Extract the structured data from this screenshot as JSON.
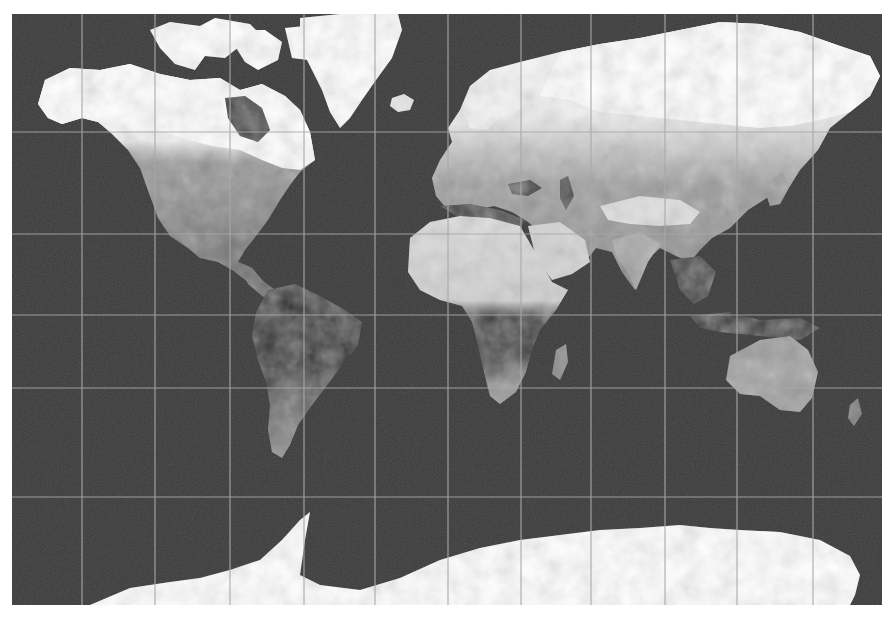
{
  "map": {
    "type": "world-map",
    "projection": "mercator",
    "style": "grayscale-satellite",
    "frame": {
      "x": 12,
      "y": 14,
      "width": 870,
      "height": 591
    },
    "colors": {
      "ocean": "#3a3a3a",
      "grid": "#a8a8a8",
      "ice": "#ffffff",
      "desert": "#d8d8d8",
      "vegetation_dark": "#262626",
      "land_mid": "#8a8a8a",
      "land_light": "#b8b8b8",
      "background": "#ffffff"
    },
    "graticule": {
      "vertical_lines_x": [
        82,
        155,
        230,
        304,
        375,
        448,
        521,
        591,
        665,
        737,
        813
      ],
      "horizontal_lines_y": [
        132,
        234,
        315,
        388,
        497
      ]
    },
    "regions": [
      "north-america",
      "greenland",
      "canadian-arctic",
      "alaska",
      "south-america",
      "europe",
      "asia",
      "africa",
      "arabia",
      "india",
      "southeast-asia",
      "australia",
      "madagascar",
      "antarctica",
      "iceland",
      "japan"
    ]
  }
}
